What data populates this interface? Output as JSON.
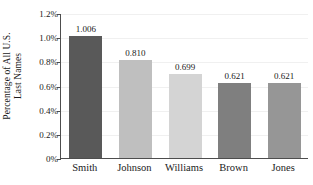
{
  "chart_data": {
    "type": "bar",
    "title": "",
    "xlabel": "",
    "ylabel": "Percentage of All U.S. Last Names",
    "ylabel_lines": [
      "Percentage of All U.S.",
      "Last Names"
    ],
    "categories": [
      "Smith",
      "Johnson",
      "Williams",
      "Brown",
      "Jones"
    ],
    "values": [
      1.006,
      0.81,
      0.699,
      0.621,
      0.621
    ],
    "value_labels": [
      "1.006",
      "0.810",
      "0.699",
      "0.621",
      "0.621"
    ],
    "bar_colors": [
      "#595959",
      "#bfbfbf",
      "#d4d4d4",
      "#7f7f7f",
      "#969696"
    ],
    "ylim": [
      0,
      1.2
    ],
    "ytick_values": [
      0,
      0.2,
      0.4,
      0.6,
      0.8,
      1.0,
      1.2
    ],
    "ytick_labels": [
      "0%",
      "0.2%",
      "0.4%",
      "0.6%",
      "0.8%",
      "1.0%",
      "1.2%"
    ],
    "grid": true,
    "legend": "none",
    "axis_color": "#4d4d4d",
    "gridline_color": "#f0f0f0"
  }
}
